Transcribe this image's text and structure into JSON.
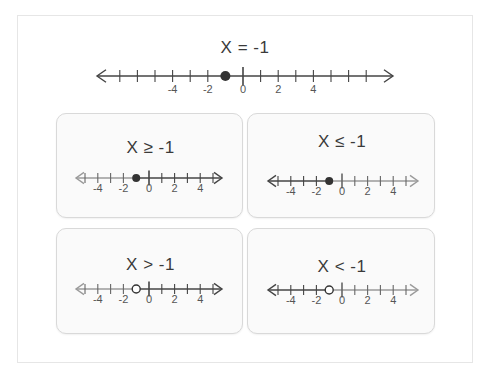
{
  "main": {
    "title": "X = -1",
    "point": -1,
    "point_style": "closed",
    "shade": "none",
    "tick_min": -7,
    "tick_max": 7,
    "labels": [
      -4,
      -2,
      0,
      2,
      4
    ]
  },
  "cards": [
    {
      "title": "X ≥ -1",
      "point": -1,
      "point_style": "closed",
      "shade": "right",
      "tick_min": -5,
      "tick_max": 5,
      "labels": [
        -4,
        -2,
        0,
        2,
        4
      ]
    },
    {
      "title": "X ≤ -1",
      "point": -1,
      "point_style": "closed",
      "shade": "left",
      "tick_min": -5,
      "tick_max": 5,
      "labels": [
        -4,
        -2,
        0,
        2,
        4
      ]
    },
    {
      "title": "X > -1",
      "point": -1,
      "point_style": "open",
      "shade": "right",
      "tick_min": -5,
      "tick_max": 5,
      "labels": [
        -4,
        -2,
        0,
        2,
        4
      ]
    },
    {
      "title": "X < -1",
      "point": -1,
      "point_style": "open",
      "shade": "left",
      "tick_min": -5,
      "tick_max": 5,
      "labels": [
        -4,
        -2,
        0,
        2,
        4
      ]
    }
  ],
  "colors": {
    "line": "#9a9a9a",
    "shaded_line": "#444444",
    "point": "#333333",
    "card_border": "#d9d9d9"
  }
}
